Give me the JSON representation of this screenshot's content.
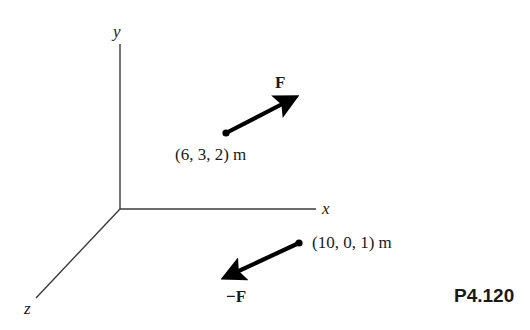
{
  "diagram": {
    "problem_number": "P4.120",
    "axes": {
      "x_label": "x",
      "y_label": "y",
      "z_label": "z"
    },
    "forces": [
      {
        "label": "F",
        "point_label": "(6, 3, 2) m",
        "point": [
          6,
          3,
          2
        ],
        "units": "m",
        "direction": "up-right"
      },
      {
        "label": "−F",
        "point_label": "(10, 0, 1) m",
        "point": [
          10,
          0,
          1
        ],
        "units": "m",
        "direction": "down-left"
      }
    ],
    "colors": {
      "axis": "#3a3a3a",
      "arrow": "#000000",
      "text": "#1a1a1a"
    }
  }
}
